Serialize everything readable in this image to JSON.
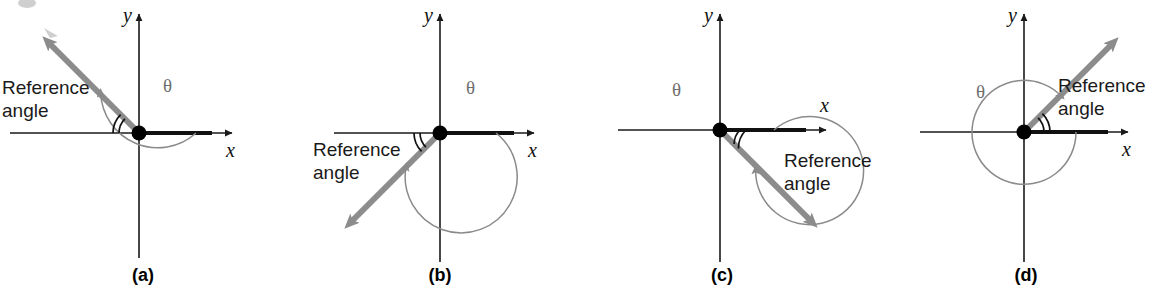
{
  "figure": {
    "background_color": "#ffffff",
    "panel_count": 4,
    "common": {
      "reference_label_line1": "Reference",
      "reference_label_line2": "angle",
      "theta_symbol": "θ",
      "x_axis_label": "x",
      "y_axis_label": "y",
      "terminal_ray_color": "#8c8c8c",
      "initial_side_color": "#111111",
      "sweep_arc_color": "#8a8a8a",
      "reference_arc_color": "#111111",
      "axis_color": "#1a1a1a"
    },
    "panels": [
      {
        "tag": "(a)",
        "quadrant": "II",
        "theta_degrees": 135,
        "reference_angle_degrees": 45,
        "terminal_ray_angle_degrees": 135,
        "sweep_direction": "counterclockwise",
        "sweep_turns": 1,
        "theta_label_position": "upper-right",
        "reference_label_position": "left",
        "theta_symbol": "θ",
        "reference_label_line1": "Reference",
        "reference_label_line2": "angle",
        "x_axis_label": "x",
        "y_axis_label": "y"
      },
      {
        "tag": "(b)",
        "quadrant": "III",
        "theta_degrees": 225,
        "reference_angle_degrees": 45,
        "terminal_ray_angle_degrees": 225,
        "sweep_direction": "counterclockwise",
        "sweep_turns": 1,
        "theta_label_position": "upper-right",
        "reference_label_position": "lower-left",
        "theta_symbol": "θ",
        "reference_label_line1": "Reference",
        "reference_label_line2": "angle",
        "x_axis_label": "x",
        "y_axis_label": "y"
      },
      {
        "tag": "(c)",
        "quadrant": "IV",
        "theta_degrees": 315,
        "reference_angle_degrees": 45,
        "terminal_ray_angle_degrees": 315,
        "sweep_direction": "counterclockwise",
        "sweep_turns": 1,
        "theta_label_position": "upper-left",
        "reference_label_position": "lower-right",
        "theta_symbol": "θ",
        "reference_label_line1": "Reference",
        "reference_label_line2": "angle",
        "x_axis_label": "x",
        "y_axis_label": "y"
      },
      {
        "tag": "(d)",
        "quadrant": "I",
        "theta_degrees": 405,
        "reference_angle_degrees": 45,
        "terminal_ray_angle_degrees": 45,
        "sweep_direction": "counterclockwise",
        "sweep_turns": 2,
        "theta_label_position": "upper-left",
        "reference_label_position": "right",
        "theta_symbol": "θ",
        "reference_label_line1": "Reference",
        "reference_label_line2": "angle",
        "x_axis_label": "x",
        "y_axis_label": "y"
      }
    ]
  }
}
